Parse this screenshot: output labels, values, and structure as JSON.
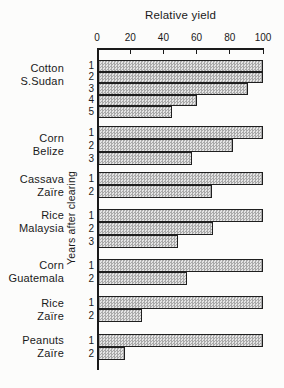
{
  "chart_data": {
    "type": "bar",
    "orientation": "horizontal",
    "title": "Relative yield",
    "ylabel": "Years after clearing",
    "xlim": [
      0,
      100
    ],
    "x_ticks": [
      0,
      20,
      40,
      60,
      80,
      100
    ],
    "grid": false,
    "legend": false,
    "bar_fill_color": "#e2e2e2",
    "bar_pattern_color": "#a9a9a9",
    "bar_border_color": "#1f1f1f",
    "groups": [
      {
        "crop": "Cotton",
        "place": "S.Sudan",
        "years": [
          1,
          2,
          3,
          4,
          5
        ],
        "values": [
          100,
          100,
          91,
          60,
          45
        ]
      },
      {
        "crop": "Corn",
        "place": "Belize",
        "years": [
          1,
          2,
          3
        ],
        "values": [
          100,
          82,
          57
        ]
      },
      {
        "crop": "Cassava",
        "place": "Zaïre",
        "years": [
          1,
          2
        ],
        "values": [
          100,
          69
        ]
      },
      {
        "crop": "Rice",
        "place": "Malaysia",
        "years": [
          1,
          2,
          3
        ],
        "values": [
          100,
          70,
          49
        ]
      },
      {
        "crop": "Corn",
        "place": "Guatemala",
        "years": [
          1,
          2
        ],
        "values": [
          100,
          54
        ]
      },
      {
        "crop": "Rice",
        "place": "Zaïre",
        "years": [
          1,
          2
        ],
        "values": [
          100,
          27
        ]
      },
      {
        "crop": "Peanuts",
        "place": "Zaïre",
        "years": [
          1,
          2
        ],
        "values": [
          100,
          17
        ]
      }
    ]
  }
}
